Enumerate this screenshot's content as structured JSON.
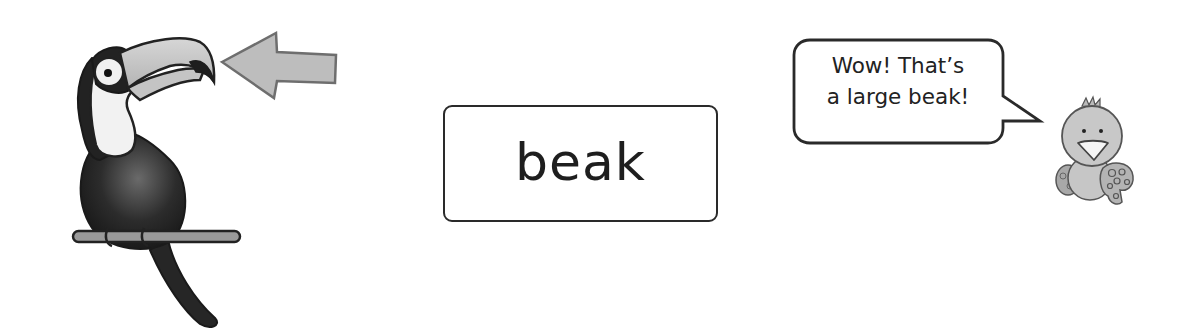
{
  "page": {
    "type": "vocabulary-card"
  },
  "word_card": {
    "word": "beak"
  },
  "illustration": {
    "subject": "toucan",
    "pointer": "arrow pointing at beak",
    "icon": "toucan-icon"
  },
  "speech_bubble": {
    "lines": [
      "Wow!  That’s",
      "a large beak!"
    ],
    "speaker_icon": "chick-icon"
  },
  "colors": {
    "outline": "#2a2a2a",
    "arrow_fill": "#bdbdbd",
    "arrow_stroke": "#6e6e6e",
    "beak_fill": "#c9c9c9",
    "bird_body": "#222222",
    "chick_fill": "#c8c8c8",
    "background": "#ffffff"
  }
}
